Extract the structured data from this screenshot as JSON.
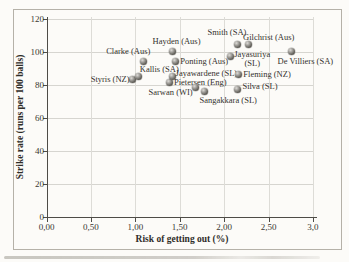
{
  "figure": {
    "background": "#fcfbf8",
    "border_color": "#b5b1a8",
    "marker_color": "#55534e"
  },
  "chart_data": {
    "type": "scatter",
    "title": "",
    "xlabel": "Risk of getting out (%)",
    "ylabel": "Strike rate (runs per 100 balls)",
    "xlim": [
      0,
      3.0
    ],
    "ylim": [
      0,
      120
    ],
    "x_ticks": [
      0,
      0.5,
      1,
      1.5,
      2,
      2.5,
      3
    ],
    "x_tick_labels": [
      "0,00",
      "0,50",
      "1,00",
      "1,50",
      "2,00",
      "2,50",
      "3,0"
    ],
    "y_ticks": [
      0,
      20,
      40,
      60,
      80,
      100,
      120
    ],
    "y_tick_labels": [
      "0",
      "20",
      "40",
      "60",
      "80",
      "100",
      "120"
    ],
    "grid": true,
    "legend": "none",
    "points": [
      {
        "label": "Styris (NZ)",
        "x": 0.97,
        "y": 83,
        "pos": "end-mid",
        "dx": -3,
        "dy": -1
      },
      {
        "label": "Kallis (SA)",
        "x": 1.04,
        "y": 85,
        "pos": "start-above",
        "dx": 1,
        "dy": -2
      },
      {
        "label": "Clarke (Aus)",
        "x": 1.09,
        "y": 94,
        "pos": "end-above",
        "dx": 7,
        "dy": -5
      },
      {
        "label": "Pietersen (Eng)",
        "x": 1.39,
        "y": 81,
        "pos": "start-mid",
        "dx": 4,
        "dy": -1
      },
      {
        "label": "Hayden (Aus)",
        "x": 1.42,
        "y": 100,
        "pos": "start-above",
        "dx": -20,
        "dy": -6
      },
      {
        "label": "Jayawardene (SL)",
        "x": 1.42,
        "y": 85,
        "pos": "start-mid",
        "dx": 3,
        "dy": -3
      },
      {
        "label": "Ponting (Aus)",
        "x": 1.45,
        "y": 94,
        "pos": "start-mid",
        "dx": 5,
        "dy": 0
      },
      {
        "label": "Sarwan (WI)",
        "x": 1.68,
        "y": 78,
        "pos": "end-mid",
        "dx": -3,
        "dy": 4
      },
      {
        "label": "Sangakkara (SL)",
        "x": 1.78,
        "y": 76,
        "pos": "start-below",
        "dx": -5,
        "dy": 5
      },
      {
        "label": "Jayasuriya (SL)",
        "label_lines": [
          "Jayasuriya",
          "(SL)"
        ],
        "x": 2.07,
        "y": 97,
        "pos": "start-mid",
        "dx": 4,
        "dy": 3
      },
      {
        "label": "Smith (SA)",
        "x": 2.15,
        "y": 104,
        "pos": "end-above",
        "dx": 9,
        "dy": -8
      },
      {
        "label": "Silva (SL)",
        "x": 2.15,
        "y": 77,
        "pos": "start-mid",
        "dx": 5,
        "dy": -3
      },
      {
        "label": "Fleming (NZ)",
        "x": 2.16,
        "y": 86,
        "pos": "start-mid",
        "dx": 5,
        "dy": -1
      },
      {
        "label": "Gilchrist (Aus)",
        "x": 2.27,
        "y": 104,
        "pos": "start-above",
        "dx": -5,
        "dy": -3
      },
      {
        "label": "De Villiers (SA)",
        "x": 2.76,
        "y": 100,
        "pos": "start-below",
        "dx": -14,
        "dy": 5
      }
    ]
  }
}
